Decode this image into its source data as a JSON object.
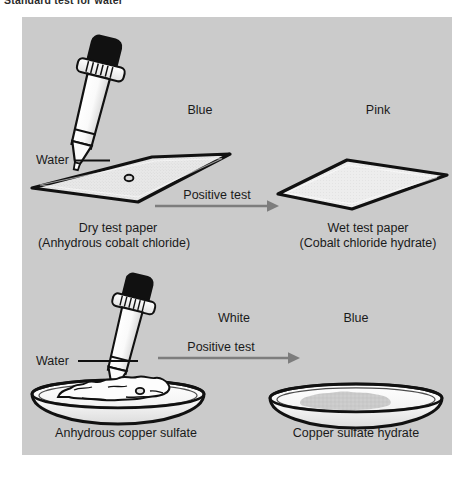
{
  "figure": {
    "caption": "Standard test for water"
  },
  "colors": {
    "panel_background": "#cbcbcb",
    "outline": "#111111",
    "paper_fill": "#e6e6e6",
    "glass_fill": "#fbfbfb",
    "bulb_fill": "#111111",
    "arrow": "#7d7d7d",
    "text": "#1a1a1a",
    "powder_fill": "#fdfdfd",
    "hydrate_fill": "#c9c9c9"
  },
  "panels": {
    "top": {
      "name": "cobalt-chloride-test",
      "reagent_label": "Water",
      "before": {
        "color_word": "Blue",
        "caption_line1": "Dry test paper",
        "caption_line2": "(Anhydrous cobalt chloride)",
        "vessel": "test-paper-strip"
      },
      "arrow_label": "Positive test",
      "after": {
        "color_word": "Pink",
        "caption_line1": "Wet test paper",
        "caption_line2": "(Cobalt chloride hydrate)",
        "vessel": "test-paper-strip"
      }
    },
    "bottom": {
      "name": "copper-sulfate-test",
      "reagent_label": "Water",
      "before": {
        "color_word": "White",
        "caption_line1": "Anhydrous copper sulfate",
        "caption_line2": "",
        "vessel": "watch-glass-with-powder"
      },
      "arrow_label": "Positive test",
      "after": {
        "color_word": "Blue",
        "caption_line1": "Copper sulfate hydrate",
        "caption_line2": "",
        "vessel": "watch-glass-with-hydrate"
      }
    }
  },
  "icons": {
    "dropper": "dropper-icon",
    "arrow": "arrow-right-icon",
    "droplet": "water-droplet-icon"
  }
}
